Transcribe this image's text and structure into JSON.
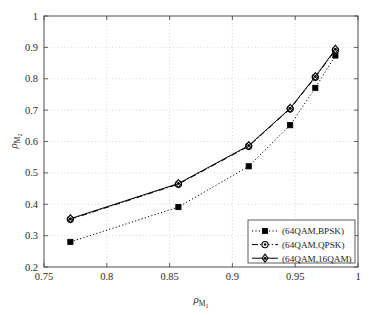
{
  "chart_data": {
    "type": "line",
    "title": "",
    "subtitle": "",
    "xlabel": "ρM₁",
    "ylabel": "ρM₂",
    "xlabel_base": "ρ",
    "xlabel_sub": "M",
    "xlabel_subsub": "1",
    "ylabel_base": "ρ",
    "ylabel_sub": "M",
    "ylabel_subsub": "2",
    "xlim": [
      0.75,
      1.0
    ],
    "ylim": [
      0.2,
      1.0
    ],
    "xticks": [
      0.75,
      0.8,
      0.85,
      0.9,
      0.95,
      1.0
    ],
    "xtick_labels": [
      "0.75",
      "0.8",
      "0.85",
      "0.9",
      "0.95",
      "1"
    ],
    "yticks": [
      0.2,
      0.3,
      0.4,
      0.5,
      0.6,
      0.7,
      0.8,
      0.9,
      1.0
    ],
    "ytick_labels": [
      "0.2",
      "0.3",
      "0.4",
      "0.5",
      "0.6",
      "0.7",
      "0.8",
      "0.9",
      "1"
    ],
    "grid": true,
    "grid_style": "dotted",
    "grid_color": "#cccccc",
    "axes_color": "#4d4d4d",
    "legend_position": "lower right",
    "x": [
      0.771,
      0.857,
      0.913,
      0.946,
      0.966,
      0.982
    ],
    "series": [
      {
        "name": "(64QAM,BPSK)",
        "values": [
          0.28,
          0.391,
          0.521,
          0.652,
          0.771,
          0.874
        ],
        "line_style": "dotted",
        "marker": "square",
        "color": "#000000",
        "legend_label": "(64QAM,BPSK)"
      },
      {
        "name": "(64QAM,QPSK)",
        "values": [
          0.352,
          0.464,
          0.585,
          0.704,
          0.805,
          0.891
        ],
        "line_style": "dashdot",
        "marker": "circle",
        "color": "#000000",
        "legend_label": "(64QAM,QPSK)"
      },
      {
        "name": "(64QAM,16QAM)",
        "values": [
          0.354,
          0.466,
          0.587,
          0.706,
          0.807,
          0.894
        ],
        "line_style": "solid",
        "marker": "diamond",
        "color": "#000000",
        "legend_label": "(64QAM,16QAM)"
      }
    ]
  },
  "legend": {
    "items": [
      {
        "label": "(64QAM,BPSK)"
      },
      {
        "label": "(64QAM,QPSK)"
      },
      {
        "label": "(64QAM,16QAM)"
      }
    ]
  }
}
